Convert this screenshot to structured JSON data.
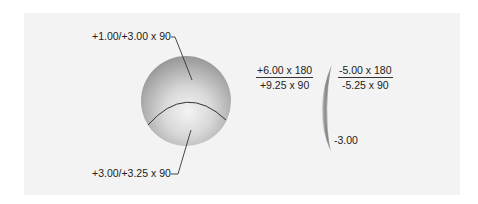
{
  "figure": {
    "sphere": {
      "upper_label": "+1.00/+3.00 x 90",
      "lower_label": "+3.00/+3.25 x 90"
    },
    "lens": {
      "front_surface": {
        "numerator": "+6.00 x 180",
        "denominator": "+9.25 x 90"
      },
      "back_surface": {
        "numerator": "-5.00 x 180",
        "denominator": "-5.25 x 90"
      },
      "edge_label": "-3.00"
    }
  },
  "colors": {
    "panel_bg": "#f3f3f3",
    "line": "#333333",
    "text": "#222222"
  }
}
